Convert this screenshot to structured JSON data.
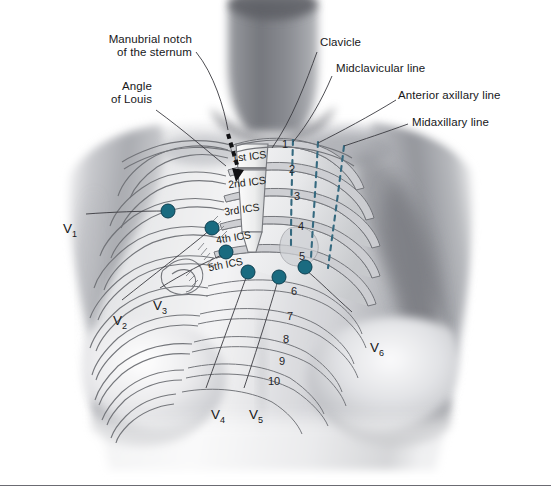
{
  "figure": {
    "baseline_visible": true
  },
  "colors": {
    "electrode": "#1a6b80",
    "electrode_edge": "#0d3f50",
    "dashed_line": "#35697f",
    "label_text": "#17171a",
    "leader_line": "#3a3a40",
    "skin_light": "#f2f2f3",
    "skin_mid": "#b9babd",
    "skin_dark": "#7d7f84",
    "rib_outline": "#6f7176",
    "baseline_rule": "#6b6b72",
    "background": "#ffffff"
  },
  "annotations": [
    {
      "id": "manubrial-notch",
      "line1": "Manubrial notch",
      "line2": "of the sternum"
    },
    {
      "id": "angle-of-louis",
      "line1": "Angle",
      "line2": "of Louis"
    },
    {
      "id": "clavicle",
      "line1": "Clavicle",
      "line2": ""
    },
    {
      "id": "midclavicular-line",
      "line1": "Midclavicular line",
      "line2": ""
    },
    {
      "id": "anterior-axillary-line",
      "line1": "Anterior axillary line",
      "line2": ""
    },
    {
      "id": "midaxillary-line",
      "line1": "Midaxillary line",
      "line2": ""
    }
  ],
  "intercostal_spaces": [
    {
      "id": "ics-1",
      "label": "1st ICS"
    },
    {
      "id": "ics-2",
      "label": "2nd ICS"
    },
    {
      "id": "ics-3",
      "label": "3rd ICS"
    },
    {
      "id": "ics-4",
      "label": "4th ICS"
    },
    {
      "id": "ics-5",
      "label": "5th ICS"
    }
  ],
  "rib_numbers": [
    "1",
    "2",
    "3",
    "4",
    "5",
    "6",
    "7",
    "8",
    "9",
    "10"
  ],
  "electrode_labels": [
    {
      "id": "v1",
      "base": "V",
      "sub": "1"
    },
    {
      "id": "v2",
      "base": "V",
      "sub": "2"
    },
    {
      "id": "v3",
      "base": "V",
      "sub": "3"
    },
    {
      "id": "v4",
      "base": "V",
      "sub": "4"
    },
    {
      "id": "v5",
      "base": "V",
      "sub": "5"
    },
    {
      "id": "v6",
      "base": "V",
      "sub": "6"
    }
  ],
  "electrodes": [
    {
      "id": "v1-dot",
      "x": 168,
      "y": 211
    },
    {
      "id": "v2-dot",
      "x": 212,
      "y": 228
    },
    {
      "id": "v3-dot",
      "x": 226,
      "y": 252
    },
    {
      "id": "v4-dot",
      "x": 248,
      "y": 272
    },
    {
      "id": "v5-dot",
      "x": 279,
      "y": 277
    },
    {
      "id": "v6-dot",
      "x": 305,
      "y": 267
    }
  ]
}
